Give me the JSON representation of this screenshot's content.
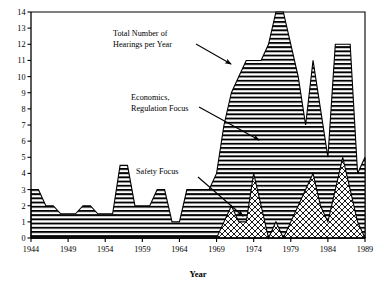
{
  "chart_data": {
    "type": "area",
    "title": "",
    "xlabel": "Year",
    "ylabel": "",
    "xlim": [
      1944,
      1989
    ],
    "ylim": [
      0,
      14
    ],
    "grid": false,
    "stacked": true,
    "legend_position": "inline-annotations",
    "x_ticks": [
      1944,
      1949,
      1954,
      1959,
      1964,
      1969,
      1974,
      1979,
      1984,
      1989
    ],
    "y_ticks": [
      0,
      1,
      2,
      3,
      4,
      5,
      6,
      7,
      8,
      9,
      10,
      11,
      12,
      13,
      14
    ],
    "x": [
      1944,
      1945,
      1946,
      1947,
      1948,
      1949,
      1950,
      1951,
      1952,
      1953,
      1954,
      1955,
      1956,
      1957,
      1958,
      1959,
      1960,
      1961,
      1962,
      1963,
      1964,
      1965,
      1966,
      1967,
      1968,
      1969,
      1970,
      1971,
      1972,
      1973,
      1974,
      1975,
      1976,
      1977,
      1978,
      1979,
      1980,
      1981,
      1982,
      1983,
      1984,
      1985,
      1986,
      1987,
      1988,
      1989
    ],
    "series": [
      {
        "name": "Safety Focus",
        "pattern": "cross-hatch",
        "values": [
          0,
          0,
          0,
          0,
          0,
          0,
          0,
          0,
          0,
          0,
          0,
          0,
          0,
          0,
          0,
          0,
          0,
          0,
          0,
          0,
          0,
          0,
          0,
          0,
          0,
          0,
          1,
          2,
          1,
          1,
          4,
          2,
          0,
          1,
          0,
          1,
          2,
          3,
          4,
          2,
          1,
          3,
          5,
          3,
          1,
          0
        ]
      },
      {
        "name": "Economics, Regulation Focus",
        "pattern": "horizontal-lines",
        "values": [
          3,
          3,
          2,
          2,
          1.5,
          1.5,
          1.5,
          2,
          2,
          1.5,
          1.5,
          1.5,
          4.5,
          4.5,
          2,
          2,
          2,
          3,
          3,
          1,
          1,
          3,
          3,
          3,
          3,
          4,
          6,
          7,
          9,
          10,
          7,
          9,
          12,
          13,
          14,
          11,
          8,
          4,
          7,
          6,
          4,
          9,
          7,
          9,
          3,
          5
        ]
      }
    ],
    "total_series_name": "Total Number of Hearings per Year",
    "totals": [
      3,
      3,
      2,
      2,
      1.5,
      1.5,
      1.5,
      2,
      2,
      1.5,
      1.5,
      1.5,
      4.5,
      4.5,
      2,
      2,
      2,
      3,
      3,
      1,
      1,
      3,
      3,
      3,
      3,
      4,
      7,
      9,
      10,
      11,
      11,
      11,
      12,
      14,
      14,
      12,
      10,
      7,
      11,
      8,
      5,
      12,
      12,
      12,
      4,
      5
    ],
    "annotations": [
      {
        "id": "total-annotation",
        "text_lines": [
          "Total Number of",
          "Hearings per Year"
        ],
        "text_x": 113,
        "text_y": 36,
        "arrow": {
          "x1": 196,
          "y1": 44,
          "x2": 231,
          "y2": 64
        }
      },
      {
        "id": "economics-annotation",
        "text_lines": [
          "Economics,",
          "Regulation Focus"
        ],
        "text_x": 131,
        "text_y": 100,
        "arrow": {
          "x1": 199,
          "y1": 107,
          "x2": 259,
          "y2": 140
        }
      },
      {
        "id": "safety-annotation",
        "text_lines": [
          "Safety Focus"
        ],
        "text_x": 136,
        "text_y": 174,
        "arrow": {
          "x1": 198,
          "y1": 177,
          "x2": 243,
          "y2": 216
        }
      }
    ]
  },
  "colors": {
    "ink": "#000000",
    "background": "#ffffff",
    "hatch": "#000000"
  }
}
